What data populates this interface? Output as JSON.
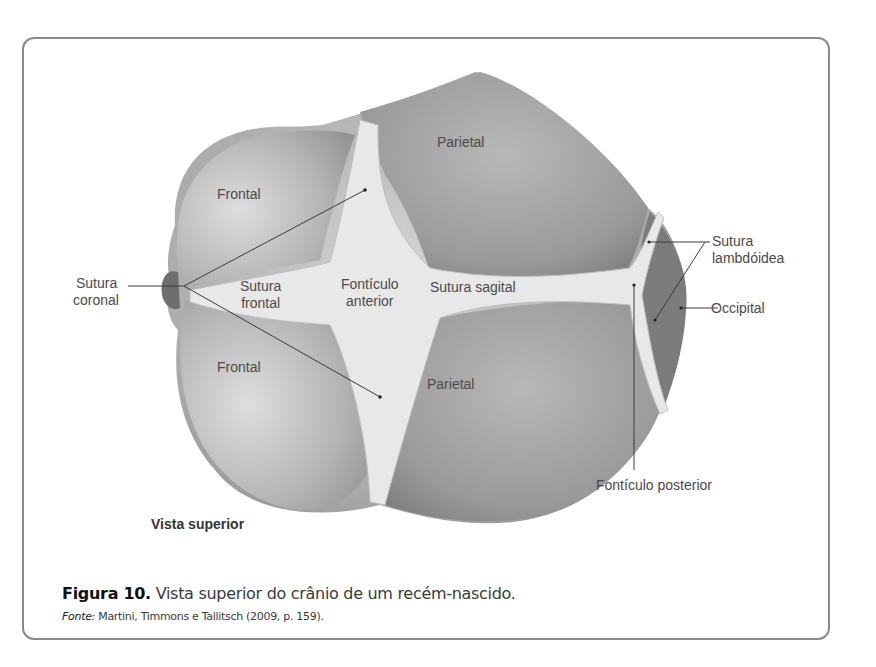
{
  "figure": {
    "view_label": "Vista superior",
    "caption_prefix": "Figura 10.",
    "caption_text": " Vista superior do crânio de um recém-nascido.",
    "source_prefix": "Fonte:",
    "source_text": " Martini, Timmons e Tallitsch (2009, p. 159)."
  },
  "labels": {
    "parietal_top": "Parietal",
    "frontal_top": "Frontal",
    "frontal_bottom": "Frontal",
    "parietal_bottom": "Parietal",
    "sutura_coronal_1": "Sutura",
    "sutura_coronal_2": "coronal",
    "sutura_frontal_1": "Sutura",
    "sutura_frontal_2": "frontal",
    "fonticulo_anterior_1": "Fontículo",
    "fonticulo_anterior_2": "anterior",
    "sutura_sagital": "Sutura sagital",
    "sutura_lambdoidea_1": "Sutura",
    "sutura_lambdoidea_2": "lambdóidea",
    "occipital": "Occipital",
    "fonticulo_posterior": "Fontículo posterior"
  }
}
